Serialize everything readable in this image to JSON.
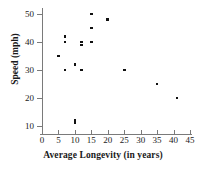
{
  "chart_data": {
    "type": "scatter",
    "title": "",
    "xlabel": "Average Longevity (in years)",
    "ylabel": "Speed (mph)",
    "xlim": [
      0,
      45
    ],
    "ylim": [
      8,
      52
    ],
    "grid": false,
    "legend": "none",
    "marker": "square",
    "marker_color": "#111111",
    "xticks": [
      0,
      5,
      10,
      15,
      20,
      25,
      30,
      35,
      40,
      45
    ],
    "xtick_labels": [
      "0",
      "5",
      "10",
      "15",
      "20",
      "25",
      "30",
      "35",
      "40",
      "45"
    ],
    "yticks": [
      10,
      20,
      30,
      40,
      50
    ],
    "ytick_labels": [
      "10",
      "20",
      "30",
      "40",
      "50"
    ],
    "points": [
      {
        "x": 5,
        "y": 35
      },
      {
        "x": 7,
        "y": 42
      },
      {
        "x": 7,
        "y": 40
      },
      {
        "x": 7,
        "y": 30
      },
      {
        "x": 10,
        "y": 32
      },
      {
        "x": 10,
        "y": 12
      },
      {
        "x": 10,
        "y": 11
      },
      {
        "x": 12,
        "y": 40
      },
      {
        "x": 12,
        "y": 39
      },
      {
        "x": 12,
        "y": 30
      },
      {
        "x": 15,
        "y": 50
      },
      {
        "x": 15,
        "y": 45
      },
      {
        "x": 15,
        "y": 40
      },
      {
        "x": 20,
        "y": 48
      },
      {
        "x": 25,
        "y": 30
      },
      {
        "x": 35,
        "y": 25
      },
      {
        "x": 41,
        "y": 20
      }
    ]
  }
}
